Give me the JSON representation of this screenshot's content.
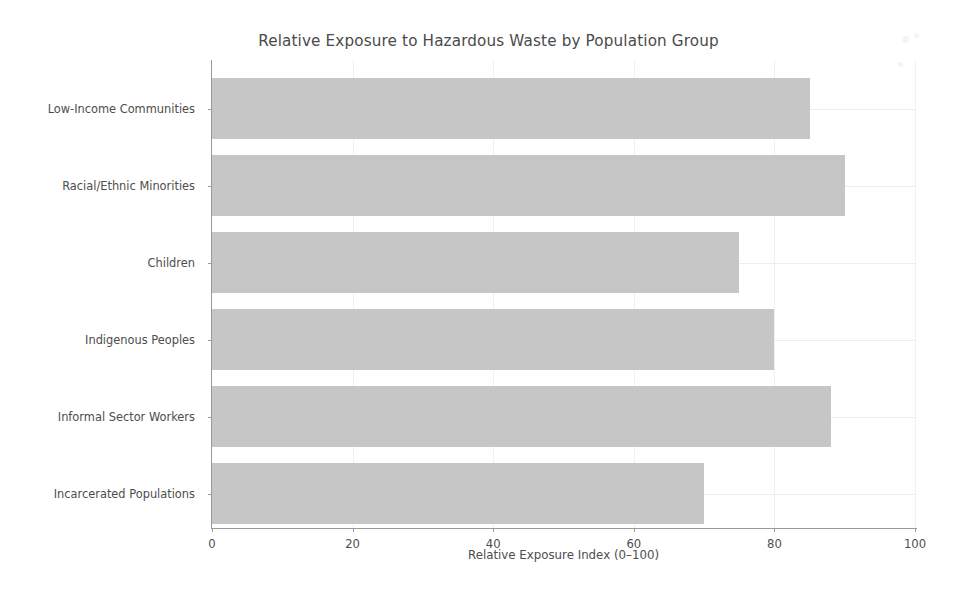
{
  "chart_data": {
    "type": "bar",
    "orientation": "horizontal",
    "title": "Relative Exposure to Hazardous Waste by Population Group",
    "xlabel": "Relative Exposure Index (0–100)",
    "ylabel": "",
    "categories": [
      "Low-Income Communities",
      "Racial/Ethnic Minorities",
      "Children",
      "Indigenous Peoples",
      "Informal Sector Workers",
      "Incarcerated Populations"
    ],
    "values": [
      85,
      90,
      75,
      80,
      88,
      70
    ],
    "xlim": [
      0,
      100
    ],
    "xticks": [
      0,
      20,
      40,
      60,
      80,
      100
    ],
    "xtick_labels": [
      "0",
      "20",
      "40",
      "60",
      "80",
      "100"
    ],
    "grid": true,
    "legend": false,
    "bar_color": "#c6c6c6",
    "background_color": "#ffffff",
    "axis_color": "#9a9a9a",
    "text_color": "#4d4d4d"
  }
}
